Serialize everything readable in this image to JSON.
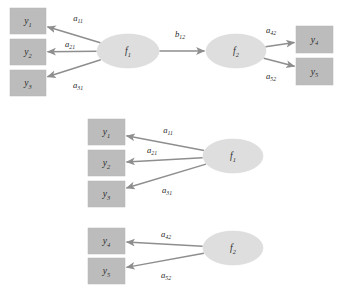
{
  "figure": {
    "type": "path-diagram",
    "background_color": "#ffffff",
    "box_fill": "#bcbcbc",
    "ellipse_fill": "#dedede",
    "edge_color": "#8e8e8e"
  },
  "panels": [
    {
      "id": "full-model",
      "name": "full-structural-model",
      "observed": [
        {
          "id": "y1",
          "base": "y",
          "sub": "1",
          "x": 10,
          "y": 8,
          "w": 36,
          "h": 26
        },
        {
          "id": "y2",
          "base": "y",
          "sub": "2",
          "x": 10,
          "y": 39,
          "w": 36,
          "h": 26
        },
        {
          "id": "y3",
          "base": "y",
          "sub": "3",
          "x": 10,
          "y": 70,
          "w": 36,
          "h": 26
        },
        {
          "id": "y4",
          "base": "y",
          "sub": "4",
          "x": 296,
          "y": 26,
          "w": 37,
          "h": 27
        },
        {
          "id": "y5",
          "base": "y",
          "sub": "5",
          "x": 296,
          "y": 58,
          "w": 37,
          "h": 27
        }
      ],
      "latent": [
        {
          "id": "f1",
          "base": "f",
          "sub": "1",
          "cx": 128,
          "cy": 51,
          "rx": 31,
          "ry": 17
        },
        {
          "id": "f2",
          "base": "f",
          "sub": "2",
          "cx": 236,
          "cy": 51,
          "rx": 30,
          "ry": 17
        }
      ],
      "edges": [
        {
          "id": "f1-y1",
          "base": "a",
          "sub": "11",
          "from": "f1",
          "to": "y1",
          "lx": 78,
          "ly": 18
        },
        {
          "id": "f1-y2",
          "base": "a",
          "sub": "21",
          "from": "f1",
          "to": "y2",
          "lx": 70,
          "ly": 44
        },
        {
          "id": "f1-y3",
          "base": "a",
          "sub": "31",
          "from": "f1",
          "to": "y3",
          "lx": 78,
          "ly": 85
        },
        {
          "id": "f1-f2",
          "base": "b",
          "sub": "12",
          "from": "f1",
          "to": "f2",
          "lx": 180,
          "ly": 34
        },
        {
          "id": "f2-y4",
          "base": "a",
          "sub": "42",
          "from": "f2",
          "to": "y4",
          "lx": 271,
          "ly": 30
        },
        {
          "id": "f2-y5",
          "base": "a",
          "sub": "52",
          "from": "f2",
          "to": "y5",
          "lx": 271,
          "ly": 76
        }
      ]
    },
    {
      "id": "measurement-f1",
      "name": "measurement-model-f1",
      "observed": [
        {
          "id": "y1b",
          "base": "y",
          "sub": "1",
          "x": 88,
          "y": 119,
          "w": 37,
          "h": 26
        },
        {
          "id": "y2b",
          "base": "y",
          "sub": "2",
          "x": 88,
          "y": 150,
          "w": 37,
          "h": 26
        },
        {
          "id": "y3b",
          "base": "y",
          "sub": "3",
          "x": 88,
          "y": 181,
          "w": 37,
          "h": 26
        }
      ],
      "latent": [
        {
          "id": "f1b",
          "base": "f",
          "sub": "1",
          "cx": 233,
          "cy": 156,
          "rx": 30,
          "ry": 17
        }
      ],
      "edges": [
        {
          "id": "f1b-y1b",
          "base": "a",
          "sub": "11",
          "from": "f1b",
          "to": "y1b",
          "lx": 168,
          "ly": 130
        },
        {
          "id": "f1b-y2b",
          "base": "a",
          "sub": "21",
          "from": "f1b",
          "to": "y2b",
          "lx": 152,
          "ly": 150
        },
        {
          "id": "f1b-y3b",
          "base": "a",
          "sub": "31",
          "from": "f1b",
          "to": "y3b",
          "lx": 167,
          "ly": 190
        }
      ]
    },
    {
      "id": "measurement-f2",
      "name": "measurement-model-f2",
      "observed": [
        {
          "id": "y4b",
          "base": "y",
          "sub": "4",
          "x": 88,
          "y": 228,
          "w": 37,
          "h": 26
        },
        {
          "id": "y5b",
          "base": "y",
          "sub": "5",
          "x": 88,
          "y": 258,
          "w": 37,
          "h": 26
        }
      ],
      "latent": [
        {
          "id": "f2b",
          "base": "f",
          "sub": "2",
          "cx": 233,
          "cy": 248,
          "rx": 30,
          "ry": 17
        }
      ],
      "edges": [
        {
          "id": "f2b-y4b",
          "base": "a",
          "sub": "42",
          "from": "f2b",
          "to": "y4b",
          "lx": 166,
          "ly": 234
        },
        {
          "id": "f2b-y5b",
          "base": "a",
          "sub": "52",
          "from": "f2b",
          "to": "y5b",
          "lx": 166,
          "ly": 275
        }
      ]
    }
  ]
}
